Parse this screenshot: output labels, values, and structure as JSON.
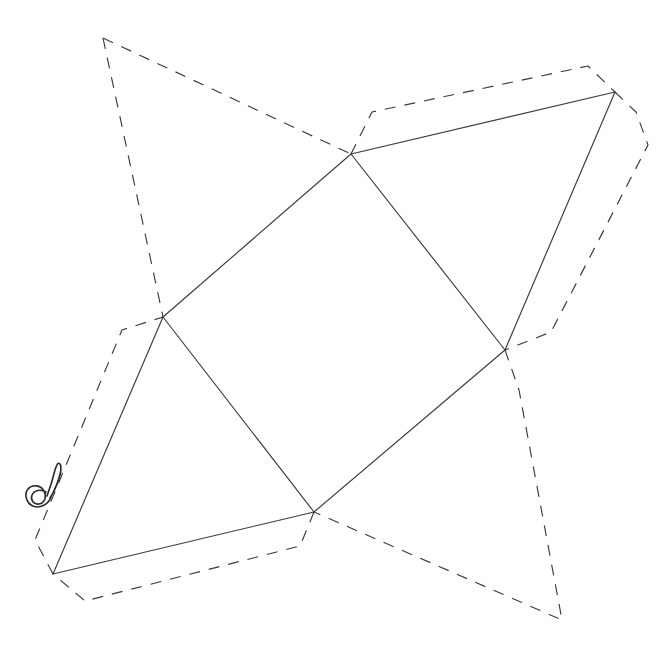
{
  "document": {
    "title": "Geometric Net Diagram",
    "background_color": "#ffffff",
    "width": 662,
    "height": 665,
    "description": "Hand-drawn style polyhedron net: solid fold lines forming a central quadrilateral band with triangular faces, surrounded by dashed outline flaps."
  },
  "style": {
    "solid_line_color": "#3a3a3f",
    "dashed_line_color": "#3a3a3f",
    "line_width": 1.15,
    "dash_pattern": "11 9"
  },
  "geometry": {
    "vertices": {
      "top_center": {
        "label": "A",
        "x": 351,
        "y": 154
      },
      "top_right": {
        "label": "B",
        "x": 615,
        "y": 92
      },
      "left_center": {
        "label": "C",
        "x": 163,
        "y": 317
      },
      "right_center": {
        "label": "D",
        "x": 505,
        "y": 350
      },
      "bottom_center": {
        "label": "E",
        "x": 314,
        "y": 512
      },
      "bottom_left": {
        "label": "F",
        "x": 53,
        "y": 574
      }
    },
    "dashed_apexes": {
      "top_left_flap_apex": {
        "label": "G",
        "x": 103,
        "y": 38
      },
      "right_flap_bulge": {
        "label": "H",
        "x": 648,
        "y": 145
      },
      "bottom_right_flap_apex": {
        "label": "I",
        "x": 562,
        "y": 620
      },
      "left_flap_corner": {
        "label": "J",
        "x": 122,
        "y": 330
      },
      "bottom_flap_corner": {
        "label": "K",
        "x": 85,
        "y": 601
      },
      "right_notch": {
        "label": "L",
        "x": 551,
        "y": 332
      }
    },
    "solid_edges": [
      {
        "name": "edge-top-center-to-top-right",
        "from": "top_center",
        "to": "top_right"
      },
      {
        "name": "edge-top-center-to-left-center",
        "from": "top_center",
        "to": "left_center"
      },
      {
        "name": "edge-top-center-to-right-center",
        "from": "top_center",
        "to": "right_center"
      },
      {
        "name": "edge-top-right-to-right-center",
        "from": "top_right",
        "to": "right_center"
      },
      {
        "name": "edge-left-center-to-bottom-center",
        "from": "left_center",
        "to": "bottom_center"
      },
      {
        "name": "edge-left-center-to-bottom-left",
        "from": "left_center",
        "to": "bottom_left"
      },
      {
        "name": "edge-right-center-to-bottom-center",
        "from": "right_center",
        "to": "bottom_center"
      },
      {
        "name": "edge-bottom-center-to-bottom-left",
        "from": "bottom_center",
        "to": "bottom_left"
      }
    ],
    "faces": [
      {
        "name": "face-central-quadrilateral",
        "vertices": [
          "top_center",
          "right_center",
          "bottom_center",
          "left_center"
        ]
      },
      {
        "name": "face-upper-right-triangle",
        "vertices": [
          "top_center",
          "top_right",
          "right_center"
        ]
      },
      {
        "name": "face-lower-left-triangle",
        "vertices": [
          "left_center",
          "bottom_center",
          "bottom_left"
        ]
      }
    ],
    "dashed_paths": [
      {
        "name": "dashed-top-left-flap",
        "points": "103,38 351,154"
      },
      {
        "name": "dashed-top-left-flap-side",
        "points": "103,38 163,317"
      },
      {
        "name": "dashed-upper-right-flap",
        "points": "351,154 372,112 588,66 615,92"
      },
      {
        "name": "dashed-right-flap",
        "points": "615,92 636,112 648,145 551,332 505,350"
      },
      {
        "name": "dashed-bottom-right-flap",
        "points": "505,350 519,390 562,620 314,512"
      },
      {
        "name": "dashed-bottom-flap",
        "points": "314,512 300,546 85,601 53,574"
      },
      {
        "name": "dashed-left-flap",
        "points": "53,574 35,540 122,330 163,317"
      }
    ]
  },
  "annotation": {
    "name": "spiral-curl-mark",
    "description": "Small hand-drawn spiral with upward tail, near the lower-left edge",
    "x": 42,
    "y": 480,
    "color": "#2b2b30"
  },
  "chart_data": {
    "type": "diagram",
    "shape_class": "polyhedron unfolding net",
    "solid_edge_count": 8,
    "dashed_flap_count": 7,
    "face_count": 3,
    "annotation_count": 1
  }
}
